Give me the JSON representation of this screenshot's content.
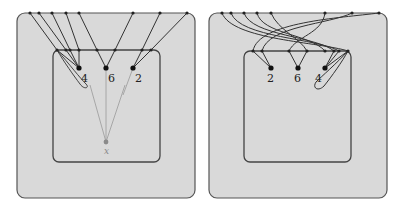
{
  "colors": {
    "panel_fill": "#d9d9d9",
    "border": "#444444",
    "line": "#333333",
    "faint_line": "#999999",
    "faint_node": "#8a8a8a"
  },
  "left_panel": {
    "node_labels": {
      "a": "4",
      "b": "6",
      "c": "2"
    },
    "root_label": "x"
  },
  "right_panel": {
    "node_labels": {
      "a": "2",
      "b": "6",
      "c": "4"
    }
  }
}
